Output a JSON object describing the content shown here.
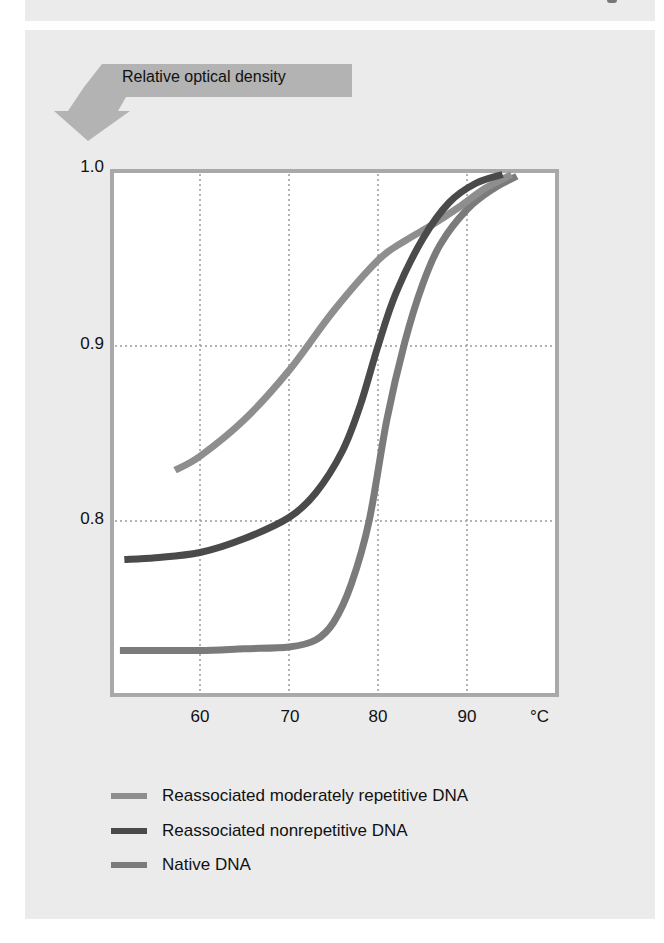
{
  "header": {
    "arrow_label": "Relative optical density"
  },
  "axes": {
    "y_ticks": [
      {
        "label": "1.0",
        "top": 158
      },
      {
        "label": "0.9",
        "top": 335
      },
      {
        "label": "0.8",
        "top": 510
      }
    ],
    "x_ticks": [
      {
        "label": "60",
        "left": 180
      },
      {
        "label": "70",
        "left": 270
      },
      {
        "label": "80",
        "left": 358
      },
      {
        "label": "90",
        "left": 447
      }
    ],
    "x_unit": "°C"
  },
  "legend": {
    "items": [
      {
        "label": "Reassociated moderately repetitive DNA",
        "color": "#8e8e8e"
      },
      {
        "label": "Reassociated nonrepetitive DNA",
        "color": "#4a4a4a"
      },
      {
        "label": "Native DNA",
        "color": "#7b7b7b"
      }
    ]
  },
  "colors": {
    "panel_background": "#ebebeb",
    "plot_background": "#ffffff",
    "frame": "#a9a9a9",
    "gridline": "#9a9a9a",
    "arrow": "#b3b3b3"
  },
  "chart_data": {
    "type": "line",
    "title": "Relative optical density",
    "xlabel": "°C",
    "ylabel": "Relative optical density",
    "xlim": [
      49.5,
      99.5
    ],
    "ylim": [
      0.701,
      1.0
    ],
    "x_ticks": [
      60,
      70,
      80,
      90
    ],
    "y_ticks": [
      0.8,
      0.9,
      1.0
    ],
    "grid": true,
    "grid_style": "dotted",
    "legend_position": "bottom",
    "series": [
      {
        "name": "Reassociated moderately repetitive DNA",
        "color": "#8e8e8e",
        "x": [
          57.2,
          60,
          65,
          70,
          75,
          80,
          83,
          86,
          89,
          92,
          95
        ],
        "y": [
          0.829,
          0.837,
          0.858,
          0.886,
          0.92,
          0.949,
          0.96,
          0.969,
          0.979,
          0.99,
          0.998
        ]
      },
      {
        "name": "Reassociated nonrepetitive DNA",
        "color": "#4a4a4a",
        "x": [
          51.5,
          55,
          60,
          65,
          70,
          73,
          76,
          78,
          80,
          82,
          85,
          88,
          91,
          94
        ],
        "y": [
          0.778,
          0.779,
          0.782,
          0.79,
          0.802,
          0.816,
          0.84,
          0.866,
          0.9,
          0.93,
          0.961,
          0.982,
          0.993,
          0.998
        ]
      },
      {
        "name": "Native DNA",
        "color": "#7b7b7b",
        "x": [
          51,
          55,
          60,
          65,
          70,
          73,
          75,
          77,
          79,
          81,
          83,
          85,
          87,
          90,
          93,
          95.6
        ],
        "y": [
          0.726,
          0.726,
          0.726,
          0.727,
          0.728,
          0.732,
          0.742,
          0.764,
          0.8,
          0.858,
          0.902,
          0.935,
          0.958,
          0.978,
          0.99,
          0.997
        ]
      }
    ]
  }
}
